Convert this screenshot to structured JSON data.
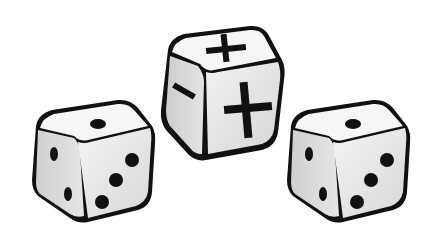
{
  "scene": {
    "description": "Three illustrated dice on white background",
    "background": "#ffffff",
    "dice": [
      {
        "position": "left",
        "type": "standard",
        "faces": {
          "top": "1",
          "left": "2",
          "front": "3"
        }
      },
      {
        "position": "center",
        "type": "fudge",
        "faces": {
          "top": "+",
          "left": "-",
          "front": "+"
        }
      },
      {
        "position": "right",
        "type": "standard",
        "faces": {
          "top": "1",
          "left": "2",
          "front": "3"
        }
      }
    ],
    "colors": {
      "outline": "#111111",
      "face_light": "#f2f2f2",
      "face_mid": "#dcdcdc",
      "face_dark": "#c4c4c4",
      "pip": "#111111"
    }
  }
}
